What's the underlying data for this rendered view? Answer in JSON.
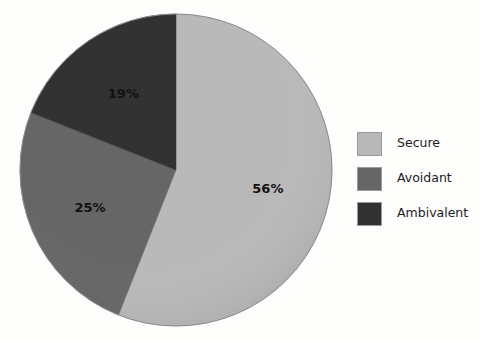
{
  "chart_data": {
    "type": "pie",
    "title": "",
    "subtitle": "",
    "xlabel": "",
    "ylabel": "",
    "grid": false,
    "legend_position": "right",
    "start_angle_deg": 0,
    "direction": "clockwise",
    "categories": [
      "Secure",
      "Avoidant",
      "Ambivalent"
    ],
    "values": [
      56,
      25,
      19
    ],
    "value_unit": "%",
    "data_labels": [
      "56%",
      "25%",
      "19%"
    ],
    "colors": [
      "#b9b9b9",
      "#666666",
      "#323232"
    ],
    "slices": [
      {
        "label": "Secure",
        "value": 56,
        "data_label": "56%",
        "color": "#b9b9b9",
        "start_deg": 0,
        "end_deg": 201.6
      },
      {
        "label": "Avoidant",
        "value": 25,
        "data_label": "25%",
        "color": "#666666",
        "start_deg": 201.6,
        "end_deg": 291.6
      },
      {
        "label": "Ambivalent",
        "value": 19,
        "data_label": "19%",
        "color": "#323232",
        "start_deg": 291.6,
        "end_deg": 360
      }
    ]
  },
  "legend": {
    "items": [
      {
        "label": "Secure",
        "color": "#b9b9b9"
      },
      {
        "label": "Avoidant",
        "color": "#666666"
      },
      {
        "label": "Ambivalent",
        "color": "#323232"
      }
    ]
  },
  "colors": {
    "background": "#fdfdfc",
    "secure": "#b9b9b9",
    "avoidant": "#666666",
    "ambivalent": "#323232",
    "label_text": "#111111",
    "legend_text": "#1c1c1c",
    "swatch_border": "#9a9a9a"
  }
}
